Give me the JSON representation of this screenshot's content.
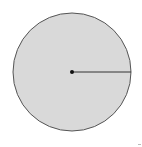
{
  "diagram": {
    "shape": "circle",
    "center": {
      "x": 72,
      "y": 72
    },
    "radius": 59,
    "fill": "#d9d9d9",
    "stroke": "#555555",
    "center_dot_color": "#111111",
    "radius_line": {
      "from": "center",
      "to": "right-edge",
      "color": "#333333"
    }
  }
}
